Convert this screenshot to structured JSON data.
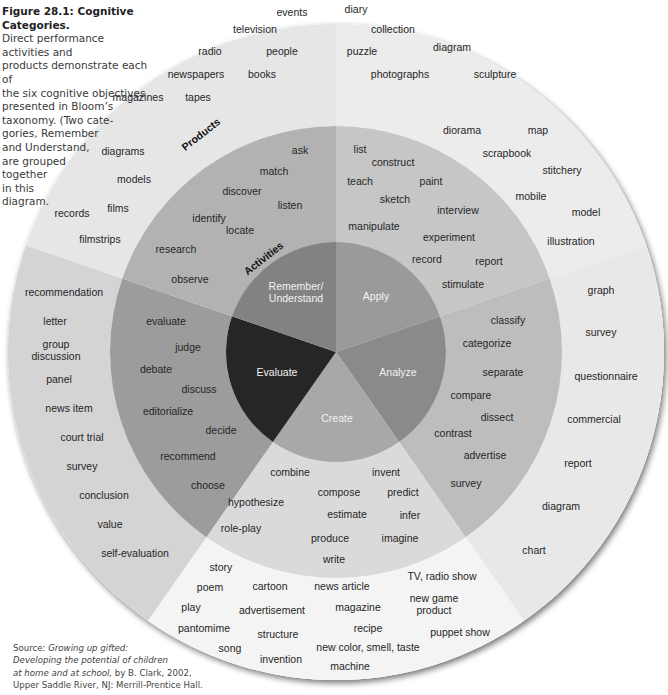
{
  "caption": {
    "title": "Figure 28.1: Cognitive Categories.",
    "lines": [
      "Direct performance activities and",
      "products demonstrate each of",
      "the six cognitive objectives",
      "presented in Bloom’s",
      "taxonomy. (Two cate-",
      "gories, Remember",
      "and Understand,",
      "are grouped",
      "together",
      "in this",
      "diagram."
    ]
  },
  "source": {
    "prefix": "Source: ",
    "title_part1": "Growing up gifted:",
    "title_part2": "Developing the potential of children",
    "title_part3": "at home and at school,",
    "suffix3": " by B. Clark, 2002,",
    "line4": "Upper Saddle River, NJ: Merrill-Prentice Hall."
  },
  "ring_labels": {
    "products": "Products",
    "activities": "Activities"
  },
  "categories": [
    {
      "name": "Remember/ Understand",
      "line1": "Remember/",
      "line2": "Understand",
      "color": "#9a9a9a"
    },
    {
      "name": "Apply",
      "line1": "Apply",
      "color": "#8a8a8a"
    },
    {
      "name": "Analyze",
      "line1": "Analyze",
      "color": "#a8a8a8"
    },
    {
      "name": "Create",
      "line1": "Create",
      "color": "#262626"
    },
    {
      "name": "Evaluate",
      "line1": "Evaluate",
      "color": "#828282"
    }
  ],
  "colors": {
    "inner": [
      "#9a9a9a",
      "#8a8a8a",
      "#a8a8a8",
      "#262626",
      "#828282"
    ],
    "middle": [
      "#c6c6c6",
      "#bdbdbd",
      "#dadada",
      "#9c9c9c",
      "#b2b2b2"
    ],
    "outer": [
      "#ececec",
      "#e8e8e8",
      "#f4f4f4",
      "#d4d4d4",
      "#e6e6e6"
    ]
  },
  "activities": {
    "remember_understand": [
      "ask",
      "match",
      "discover",
      "listen",
      "identify",
      "locate",
      "research",
      "observe"
    ],
    "apply": [
      "list",
      "construct",
      "teach",
      "paint",
      "sketch",
      "interview",
      "manipulate",
      "experiment",
      "record",
      "report",
      "stimulate"
    ],
    "analyze": [
      "classify",
      "categorize",
      "separate",
      "compare",
      "dissect",
      "contrast",
      "advertise",
      "survey"
    ],
    "create": [
      "combine",
      "invent",
      "compose",
      "predict",
      "hypothesize",
      "estimate",
      "infer",
      "role-play",
      "produce",
      "imagine",
      "write"
    ],
    "evaluate": [
      "evaluate",
      "judge",
      "debate",
      "discuss",
      "editorialize",
      "decide",
      "recommend",
      "choose"
    ]
  },
  "products": {
    "remember_understand": [
      "events",
      "television",
      "radio",
      "people",
      "newspapers",
      "books",
      "magazines",
      "tapes",
      "diagrams",
      "models",
      "films",
      "records",
      "filmstrips"
    ],
    "apply": [
      "diary",
      "collection",
      "puzzle",
      "diagram",
      "photographs",
      "sculpture",
      "diorama",
      "map",
      "scrapbook",
      "stitchery",
      "mobile",
      "model",
      "illustration"
    ],
    "analyze": [
      "graph",
      "survey",
      "questionnaire",
      "commercial",
      "report",
      "diagram",
      "chart"
    ],
    "create": [
      "story",
      "poem",
      "cartoon",
      "news article",
      "TV, radio show",
      "play",
      "advertisement",
      "magazine",
      "new game product",
      "pantomime",
      "structure",
      "recipe",
      "puppet show",
      "song",
      "invention",
      "new color, smell, taste",
      "machine"
    ],
    "evaluate": [
      "recommendation",
      "letter",
      "group discussion",
      "panel",
      "news item",
      "court trial",
      "survey",
      "conclusion",
      "value",
      "self-evaluation"
    ]
  },
  "create_multi": {
    "new_game_1": "new game",
    "new_game_2": "product",
    "group_1": "group",
    "group_2": "discussion"
  }
}
